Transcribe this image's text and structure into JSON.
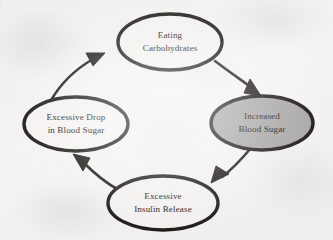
{
  "figure": {
    "kind": "cycle-diagram",
    "background_color": "#f4f3f1",
    "stroke_color": "#1a1714",
    "text_color": "#15120f",
    "highlight_fill": "#a9a7a4",
    "plain_fill": "#f4f3f1"
  },
  "nodes": [
    {
      "id": "eating-carbohydrates",
      "name": "node-eating-carbohydrates",
      "lines": [
        "Eating",
        "Carbohydrates"
      ],
      "position": "top",
      "cx": 170,
      "cy": 42,
      "rx": 52,
      "ry": 28,
      "fill": "#f4f3f1",
      "highlighted": false
    },
    {
      "id": "increased-blood-sugar",
      "name": "node-increased-blood-sugar",
      "lines": [
        "Increased",
        "Blood Sugar"
      ],
      "position": "right",
      "cx": 262,
      "cy": 123,
      "rx": 51,
      "ry": 27,
      "fill": "#a9a7a4",
      "highlighted": true
    },
    {
      "id": "excessive-insulin-release",
      "name": "node-excessive-insulin-release",
      "lines": [
        "Excessive",
        "Insulin Release"
      ],
      "position": "bottom",
      "cx": 163,
      "cy": 203,
      "rx": 55,
      "ry": 27,
      "fill": "#f4f3f1",
      "highlighted": false
    },
    {
      "id": "excessive-drop-in-blood-sugar",
      "name": "node-excessive-drop-in-blood-sugar",
      "lines": [
        "Excessive Drop",
        "in Blood Sugar"
      ],
      "position": "left",
      "cx": 76,
      "cy": 124,
      "rx": 52,
      "ry": 27,
      "fill": "#f4f3f1",
      "highlighted": false
    }
  ],
  "edges": [
    {
      "id": "edge-eating-to-increased",
      "name": "arrow-eating-to-increased",
      "from": "eating-carbohydrates",
      "to": "increased-blood-sugar",
      "direction": "clockwise",
      "path": "M 214 62 C 232 76 244 82 254 90",
      "arrow_tip": [
        258,
        95
      ],
      "arrow_angle": 48
    },
    {
      "id": "edge-increased-to-insulin",
      "name": "arrow-increased-to-insulin",
      "from": "increased-blood-sugar",
      "to": "excessive-insulin-release",
      "direction": "clockwise",
      "path": "M 250 147 C 238 160 229 169 219 176",
      "arrow_tip": [
        213,
        181
      ],
      "arrow_angle": 138
    },
    {
      "id": "edge-insulin-to-drop",
      "name": "arrow-insulin-to-drop",
      "from": "excessive-insulin-release",
      "to": "excessive-drop-in-blood-sugar",
      "direction": "clockwise",
      "path": "M 116 188 C 102 180 92 171 82 161",
      "arrow_tip": [
        76,
        155
      ],
      "arrow_angle": 225
    },
    {
      "id": "edge-drop-to-eating",
      "name": "arrow-drop-to-eating",
      "from": "excessive-drop-in-blood-sugar",
      "to": "eating-carbohydrates",
      "direction": "clockwise",
      "path": "M 51 101 C 62 83 78 68 96 58",
      "arrow_tip": [
        104,
        54
      ],
      "arrow_angle": -30
    }
  ]
}
